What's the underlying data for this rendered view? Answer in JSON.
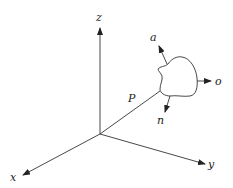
{
  "diagram": {
    "type": "3d-coordinate-frame",
    "axes": {
      "x_label": "x",
      "y_label": "y",
      "z_label": "z"
    },
    "position_vector_label": "P",
    "object_frame": {
      "approach_label": "a",
      "orientation_label": "o",
      "normal_label": "n"
    },
    "colors": {
      "stroke": "#333333",
      "background": "#ffffff"
    }
  }
}
